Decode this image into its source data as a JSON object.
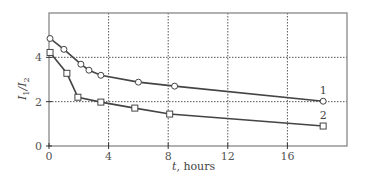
{
  "chart_data": {
    "type": "line",
    "title": "",
    "xlabel": "t, hours",
    "ylabel": "I1/I2",
    "xlim": [
      0,
      20
    ],
    "ylim": [
      0,
      6
    ],
    "xticks": [
      0,
      4,
      8,
      12,
      16
    ],
    "yticks": [
      0,
      2,
      4
    ],
    "grid": true,
    "legend": "inline labels at series end",
    "series": [
      {
        "name": "1",
        "marker": "circle",
        "x": [
          0.07,
          1.0,
          2.14,
          2.68,
          3.48,
          6.0,
          8.43,
          18.4
        ],
        "y": [
          4.85,
          4.36,
          3.69,
          3.42,
          3.19,
          2.88,
          2.7,
          2.02
        ]
      },
      {
        "name": "2",
        "marker": "square",
        "x": [
          0.07,
          1.2,
          1.94,
          3.48,
          5.76,
          8.1,
          18.4
        ],
        "y": [
          4.22,
          3.28,
          2.2,
          1.98,
          1.71,
          1.44,
          0.9
        ]
      }
    ]
  },
  "axis": {
    "x_label_var": "t",
    "x_label_unit": ", hours",
    "y_label_main": "I",
    "y_sub1": "1",
    "y_sep": "/I",
    "y_sub2": "2"
  },
  "colors": {
    "line": "#444444",
    "grid": "#555555",
    "frame": "#888888"
  }
}
